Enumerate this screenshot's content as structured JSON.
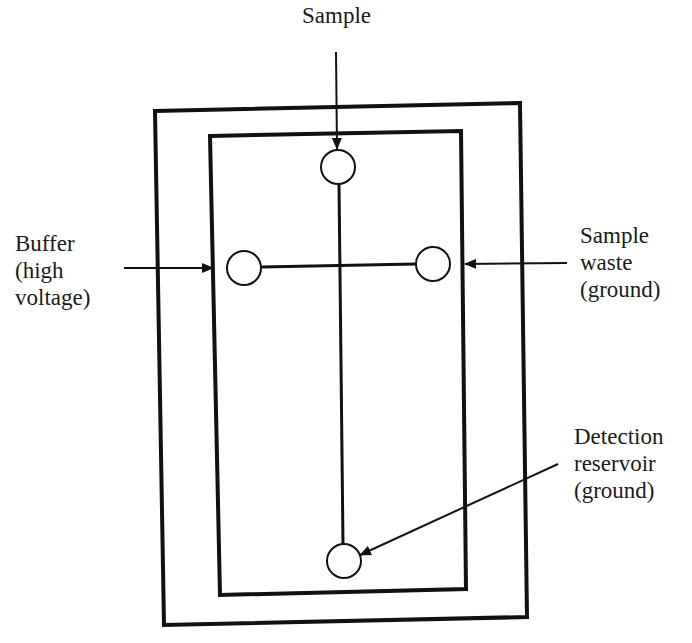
{
  "diagram": {
    "type": "microfluidic chip schematic",
    "colors": {
      "stroke": "#111111",
      "text": "#1a1a1a",
      "background": "#ffffff"
    },
    "labels": {
      "sample": {
        "lines": [
          "Sample"
        ]
      },
      "buffer": {
        "lines": [
          "Buffer",
          "(high",
          "voltage)"
        ]
      },
      "sample_waste": {
        "lines": [
          "Sample",
          "waste",
          "(ground)"
        ]
      },
      "detection": {
        "lines": [
          "Detection",
          "reservoir",
          "(ground)"
        ]
      }
    },
    "reservoirs": [
      {
        "name": "sample",
        "cx": 338,
        "cy": 167,
        "r": 17
      },
      {
        "name": "buffer",
        "cx": 244,
        "cy": 268,
        "r": 17
      },
      {
        "name": "sample-waste",
        "cx": 433,
        "cy": 264,
        "r": 17
      },
      {
        "name": "detection",
        "cx": 344,
        "cy": 561,
        "r": 17
      }
    ]
  }
}
